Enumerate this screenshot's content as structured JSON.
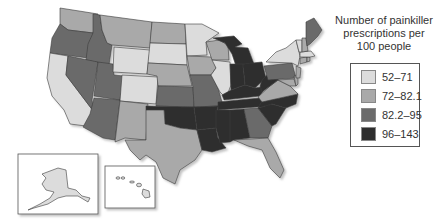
{
  "legend": {
    "title_lines": [
      "Number of painkiller",
      "prescriptions per",
      "100 people"
    ],
    "items": [
      {
        "label": "52–71",
        "color": "#dcdcdc"
      },
      {
        "label": "72–82.1",
        "color": "#a9a9a9"
      },
      {
        "label": "82.2–95",
        "color": "#6b6b6b"
      },
      {
        "label": "96–143",
        "color": "#2e2e2e"
      }
    ]
  },
  "classes": {
    "c1": "#dcdcdc",
    "c2": "#a9a9a9",
    "c3": "#6b6b6b",
    "c4": "#2e2e2e"
  },
  "insets": [
    "Alaska",
    "Hawaii"
  ]
}
